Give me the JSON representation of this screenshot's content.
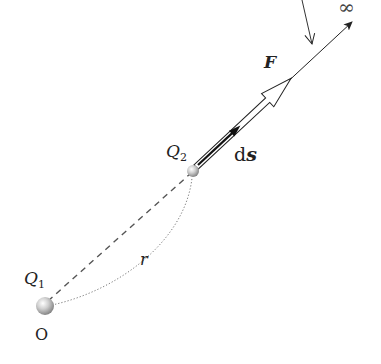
{
  "labels": {
    "charge1": "Q",
    "charge1_sub": "1",
    "charge2": "Q",
    "charge2_sub": "2",
    "origin": "O",
    "distance": "r",
    "force": "F",
    "displacement_d": "d",
    "displacement_s": "s",
    "infinity": "∞"
  },
  "colors": {
    "line": "#222222",
    "dashed": "#555555",
    "dotted": "#777777",
    "ball_light": "#f4f4f4",
    "ball_dark": "#8a8a8a"
  }
}
